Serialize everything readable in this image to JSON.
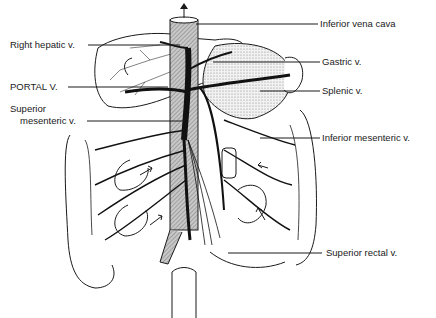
{
  "diagram": {
    "labels": {
      "inferior_vena_cava": "Inferior vena cava",
      "right_hepatic_v": "Right hepatic v.",
      "gastric_v": "Gastric v.",
      "portal_v": "PORTAL V.",
      "splenic_v": "Splenic v.",
      "superior_mesenteric_v_line1": "Superior",
      "superior_mesenteric_v_line2": "mesenteric v.",
      "inferior_mesenteric_v": "Inferior mesenteric v.",
      "superior_rectal_v": "Superior rectal v."
    },
    "colors": {
      "ink": "#1a1a1a",
      "ivc_fill": "#9a9a9a",
      "stomach_fill": "#d8d8d8",
      "background": "#ffffff"
    }
  }
}
